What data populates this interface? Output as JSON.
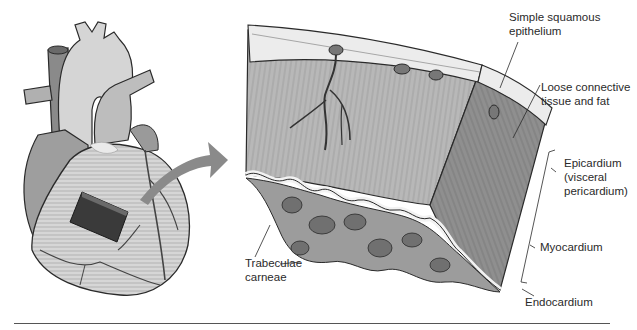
{
  "figure": {
    "colors": {
      "background": "#ffffff",
      "outline": "#2a2a2a",
      "heart_light": "#d8d8d8",
      "heart_mid": "#a8a8a8",
      "heart_dark": "#808080",
      "patch": "#3a3a3a",
      "arrow": "#8a8a8a",
      "muscle": "#b5b5b5",
      "muscle_side": "#8f8f8f",
      "epicardium": "#ececec",
      "trabeculae": "#9c9c9c",
      "trabeculae_dark": "#707070",
      "label_text": "#2a2a2a"
    },
    "labels": {
      "simple_squamous": [
        "Simple squamous",
        "epithelium"
      ],
      "loose_connective": [
        "Loose connective",
        "tissue and fat"
      ],
      "epicardium": [
        "Epicardium",
        "(visceral",
        "pericardium)"
      ],
      "myocardium": "Myocardium",
      "endocardium": "Endocardium",
      "trabeculae": [
        "Trabeculae",
        "carneae"
      ]
    }
  }
}
